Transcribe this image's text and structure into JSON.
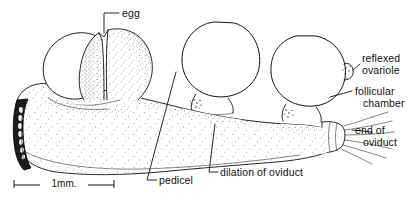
{
  "figure": {
    "kind": "scientific-line-drawing",
    "background_color": "#ffffff",
    "ink_color": "#111111"
  },
  "labels": {
    "egg": "egg",
    "reflexed_ovariole": "reflexed\novariole",
    "reflexed_ovariole_line1": "reflexed",
    "reflexed_ovariole_line2": "ovariole",
    "follicular_chamber_line1": "follicular",
    "follicular_chamber_line2": "chamber",
    "end_of_oviduct_line1": "end of",
    "end_of_oviduct_line2": "oviduct",
    "pedicel": "pedicel",
    "dilation_of_oviduct": "dilation of oviduct"
  },
  "scale_bar": {
    "text": "1mm.",
    "length_px": 100,
    "represents": "1 mm"
  }
}
